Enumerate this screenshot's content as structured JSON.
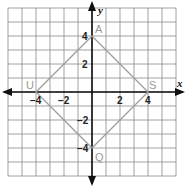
{
  "diagram": {
    "type": "coordinate-plane",
    "axes": {
      "x_label": "x",
      "y_label": "y"
    },
    "x_ticks": [
      {
        "value": -4,
        "label": "−4"
      },
      {
        "value": -2,
        "label": "−2"
      },
      {
        "value": 2,
        "label": "2"
      },
      {
        "value": 4,
        "label": "4"
      }
    ],
    "y_ticks": [
      {
        "value": 4,
        "label": "4"
      },
      {
        "value": 2,
        "label": "2"
      },
      {
        "value": -2,
        "label": "−2"
      },
      {
        "value": -4,
        "label": "−4"
      }
    ],
    "grid_range": {
      "xmin": -6,
      "xmax": 6,
      "ymin": -6,
      "ymax": 6
    },
    "vertices": [
      {
        "name": "A",
        "x": 0,
        "y": 4
      },
      {
        "name": "S",
        "x": 4,
        "y": 0
      },
      {
        "name": "Q",
        "x": 0,
        "y": -4
      },
      {
        "name": "U",
        "x": -4,
        "y": 0
      }
    ],
    "shape_color": "#a0a0a0",
    "grid_color": "#8a8a8a"
  }
}
